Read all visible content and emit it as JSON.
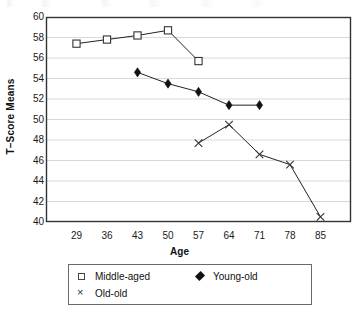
{
  "chart_data": {
    "type": "line",
    "title": "",
    "xlabel": "Age",
    "ylabel": "T–Score Means",
    "x": [
      29,
      36,
      43,
      50,
      57,
      64,
      71,
      78,
      85
    ],
    "xticklabels": [
      "29",
      "36",
      "43",
      "50",
      "57",
      "64",
      "71",
      "78",
      "85"
    ],
    "yticklabels": [
      "60",
      "58",
      "56",
      "54",
      "52",
      "50",
      "48",
      "46",
      "44",
      "42",
      "40"
    ],
    "yticks": [
      60,
      58,
      56,
      54,
      52,
      50,
      48,
      46,
      44,
      42,
      40
    ],
    "ylim": [
      40,
      60
    ],
    "xlim": [
      22,
      92
    ],
    "grid": "horizontal",
    "legend_position": "bottom",
    "series": [
      {
        "name": "Middle-aged",
        "marker": "open-square",
        "x": [
          29,
          36,
          43,
          50,
          57
        ],
        "values": [
          57.4,
          57.8,
          58.2,
          58.7,
          55.7
        ]
      },
      {
        "name": "Young-old",
        "marker": "filled-diamond",
        "x": [
          43,
          50,
          57,
          64,
          71
        ],
        "values": [
          54.6,
          53.5,
          52.7,
          51.4,
          51.4
        ]
      },
      {
        "name": "Old-old",
        "marker": "x-cross",
        "x": [
          57,
          64,
          71,
          78,
          85
        ],
        "values": [
          47.7,
          49.5,
          46.6,
          45.6,
          40.5
        ]
      }
    ]
  },
  "legend": {
    "entries": [
      {
        "label": "Middle-aged",
        "symbol": "open-square-icon"
      },
      {
        "label": "Young-old",
        "symbol": "filled-diamond-icon"
      },
      {
        "label": "Old-old",
        "symbol": "x-cross-icon"
      }
    ]
  },
  "colors": {
    "line": "#222222",
    "axis": "#333333",
    "gridline": "#d9d9d9",
    "marker_fill": "#111111",
    "background": "#ffffff"
  }
}
